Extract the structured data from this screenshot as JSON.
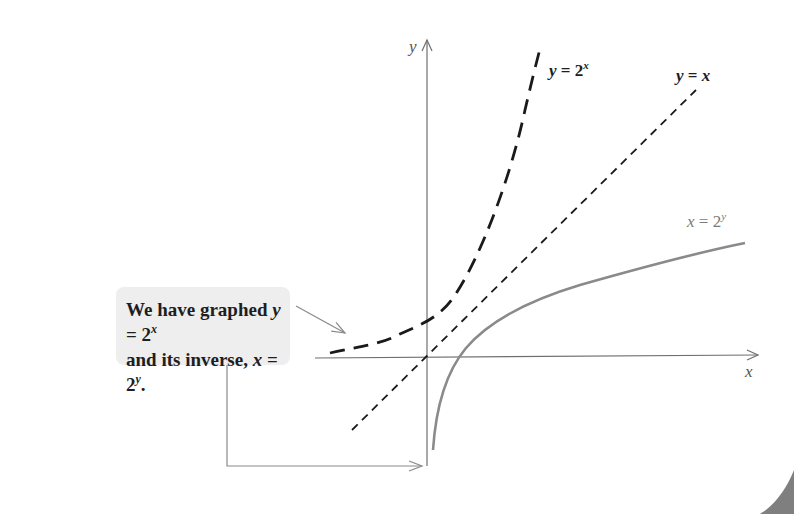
{
  "callout": {
    "line1_prefix": "We have graphed ",
    "line1_var": "y",
    "line1_eq": " = 2",
    "line1_exp": "x",
    "line2_prefix": "and its inverse, ",
    "line2_var": "x",
    "line2_eq": " = 2",
    "line2_exp": "y",
    "line2_suffix": "."
  },
  "labels": {
    "exp_curve": {
      "var": "y",
      "eq": " = 2",
      "exp": "x"
    },
    "identity_line": {
      "var1": "y",
      "eq": " = ",
      "var2": "x"
    },
    "log_curve": {
      "var": "x",
      "eq": " = 2",
      "exp": "y"
    }
  },
  "axes": {
    "x_label": "x",
    "y_label": "y"
  },
  "colors": {
    "background": "#ffffff",
    "axis": "#6f6f6f",
    "exp_curve": "#1a1a1a",
    "identity_line": "#1a1a1a",
    "log_curve": "#8a8a8a",
    "callout_bg": "#eeeeee",
    "arrow": "#8a8a8a"
  }
}
